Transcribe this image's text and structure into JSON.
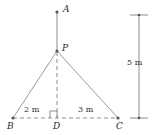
{
  "figure": {
    "type": "geometry-diagram",
    "colors": {
      "stroke": "#8c8c8c",
      "text": "#2b2b2b",
      "background": "#ffffff"
    },
    "points": [
      {
        "id": "A",
        "label": "A",
        "x": 57,
        "y": 12
      },
      {
        "id": "P",
        "label": "P",
        "x": 57,
        "y": 51
      },
      {
        "id": "B",
        "label": "B",
        "x": 13,
        "y": 118
      },
      {
        "id": "D",
        "label": "D",
        "x": 57,
        "y": 118
      },
      {
        "id": "C",
        "label": "C",
        "x": 118,
        "y": 118
      }
    ],
    "segments": [
      {
        "id": "AP",
        "from": "A",
        "to": "P",
        "style": "solid"
      },
      {
        "id": "PB",
        "from": "P",
        "to": "B",
        "style": "solid"
      },
      {
        "id": "PC",
        "from": "P",
        "to": "C",
        "style": "solid"
      },
      {
        "id": "PD",
        "from": "P",
        "to": "D",
        "style": "dashed"
      },
      {
        "id": "BC",
        "from": "B",
        "to": "C",
        "style": "dashed"
      }
    ],
    "right_angle": {
      "at": "D",
      "size": 7
    },
    "dimensions": [
      {
        "id": "BD",
        "label": "2 m",
        "value": 2,
        "unit": "m",
        "between": [
          "B",
          "D"
        ]
      },
      {
        "id": "DC",
        "label": "3 m",
        "value": 3,
        "unit": "m",
        "between": [
          "D",
          "C"
        ]
      },
      {
        "id": "scale",
        "label": "5 m",
        "value": 5,
        "unit": "m",
        "orientation": "vertical"
      }
    ],
    "scale_bar": {
      "label": "5 m",
      "x": 139,
      "top": 15,
      "bottom": 118,
      "cap_half_width": 9
    }
  }
}
